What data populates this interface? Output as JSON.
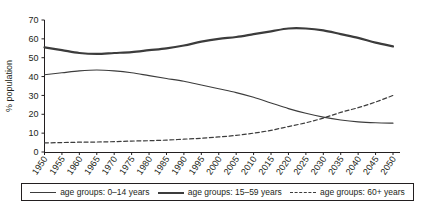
{
  "chart_data": {
    "type": "line",
    "title": "",
    "xlabel": "",
    "ylabel": "% population",
    "ylim": [
      0,
      70
    ],
    "ytick_step": 10,
    "yticks": [
      "0",
      "10",
      "20",
      "30",
      "40",
      "50",
      "60",
      "70"
    ],
    "grid": false,
    "legend_position": "bottom",
    "x": [
      1950,
      1955,
      1960,
      1965,
      1970,
      1975,
      1980,
      1985,
      1990,
      1995,
      2000,
      2005,
      2010,
      2015,
      2020,
      2025,
      2030,
      2035,
      2040,
      2045,
      2050
    ],
    "categories": [
      "1950",
      "1955",
      "1960",
      "1965",
      "1970",
      "1975",
      "1980",
      "1985",
      "1990",
      "1995",
      "2000",
      "2005",
      "2010",
      "2015",
      "2020",
      "2025",
      "2030",
      "2035",
      "2040",
      "2045",
      "2050"
    ],
    "series": [
      {
        "name": "age groups: 0–14 years",
        "style": "solid-thin",
        "color": "#3c3c3c",
        "values": [
          41,
          42,
          43,
          43.5,
          43,
          42,
          40.5,
          39,
          37.5,
          35.5,
          33.5,
          31.5,
          29,
          26,
          23,
          20.5,
          18.5,
          17,
          16,
          15.5,
          15.3
        ]
      },
      {
        "name": "age groups: 15–59 years",
        "style": "solid-thick",
        "color": "#3c3c3c",
        "values": [
          55.5,
          54,
          52.5,
          52,
          52.5,
          53,
          54,
          55,
          56.5,
          58.5,
          60,
          61,
          62.5,
          64,
          65.5,
          65.5,
          64.5,
          62.5,
          60.5,
          58,
          56
        ]
      },
      {
        "name": "age groups: 60+ years",
        "style": "dashed",
        "color": "#3c3c3c",
        "values": [
          4.8,
          5,
          5.2,
          5.3,
          5.5,
          5.8,
          6,
          6.3,
          6.8,
          7.3,
          8,
          8.8,
          10,
          11.5,
          13.5,
          15.5,
          18,
          21,
          23.5,
          26.5,
          30
        ]
      }
    ]
  },
  "legend": {
    "items": [
      {
        "label": "age groups: 0–14 years",
        "style": "solid-thin"
      },
      {
        "label": "age groups: 15–59 years",
        "style": "solid-thick"
      },
      {
        "label": "age groups: 60+ years",
        "style": "dashed"
      }
    ]
  }
}
